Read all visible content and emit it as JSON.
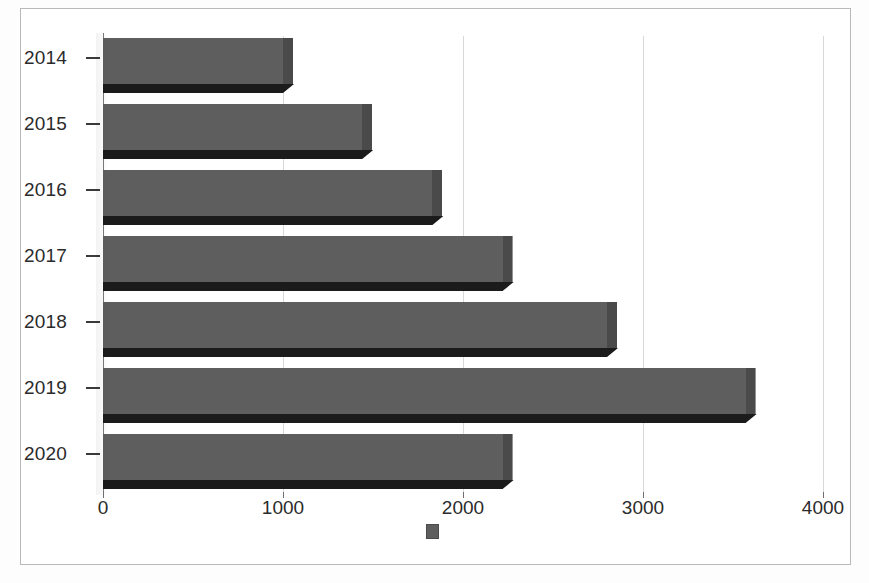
{
  "chart_data": {
    "type": "bar",
    "orientation": "horizontal",
    "title": "",
    "subtitle": "",
    "xlabel": "",
    "ylabel": "",
    "categories": [
      "2014",
      "2015",
      "2016",
      "2017",
      "2018",
      "2019",
      "2020"
    ],
    "values": [
      1000,
      1440,
      1830,
      2220,
      2800,
      3570,
      2220
    ],
    "series": [
      {
        "name": "",
        "values": [
          1000,
          1440,
          1830,
          2220,
          2800,
          3570,
          2220
        ],
        "color": "#5e5e5e"
      }
    ],
    "xlim": [
      0,
      4000
    ],
    "x_ticks": [
      0,
      1000,
      2000,
      3000,
      4000
    ],
    "x_tick_labels": [
      "0",
      "1000",
      "2000",
      "3000",
      "4000"
    ],
    "y_tick_labels": [
      "2014",
      "2015",
      "2016",
      "2017",
      "2018",
      "2019",
      "2020"
    ],
    "grid": true,
    "grid_axis": "x",
    "legend": true,
    "legend_position": "bottom",
    "legend_entries": [
      {
        "label": "",
        "color": "#5e5e5e"
      }
    ],
    "style": "3d-bar",
    "frame": true
  },
  "colors": {
    "bar_face": "#5e5e5e",
    "bar_shadow": "#1b1b1b",
    "bar_cap": "#4a4a4a",
    "gridline": "#d8d8d8",
    "axis": "#7a7a7a",
    "text": "#2b2b2b",
    "frame_border": "#b9b9b9",
    "background": "#ffffff"
  },
  "axis": {
    "x_tick_values": [
      "0",
      "1000",
      "2000",
      "3000",
      "4000"
    ],
    "y_tick_values": [
      "2014",
      "2015",
      "2016",
      "2017",
      "2018",
      "2019",
      "2020"
    ]
  }
}
